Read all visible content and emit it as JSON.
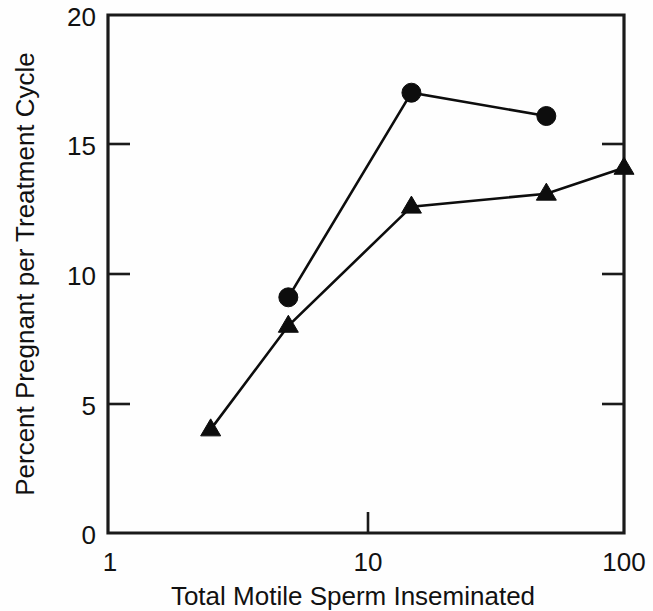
{
  "chart_data": {
    "type": "line",
    "title": "",
    "subtitle": "",
    "xlabel": "Total Motile Sperm Inseminated",
    "ylabel": "Percent Pregnant per Treatment Cycle",
    "xscale": "log",
    "yscale": "linear",
    "xlim": [
      1,
      100
    ],
    "ylim": [
      0,
      20
    ],
    "xticks": [
      1,
      10,
      100
    ],
    "xtick_labels": [
      "1",
      "10",
      "100"
    ],
    "yticks": [
      0,
      5,
      10,
      15,
      20
    ],
    "ytick_labels": [
      "0",
      "5",
      "10",
      "15",
      "20"
    ],
    "grid": false,
    "legend": "none",
    "marker_color": "#0d0d0d",
    "line_color": "#0d0d0d",
    "background_color": "#fefefe",
    "series": [
      {
        "name": "circle-series",
        "marker": "circle",
        "x": [
          5,
          15,
          50
        ],
        "y": [
          9.1,
          17.0,
          16.1
        ]
      },
      {
        "name": "triangle-series",
        "marker": "triangle",
        "x": [
          2.5,
          5,
          15,
          50,
          100
        ],
        "y": [
          4.0,
          8.0,
          12.6,
          13.1,
          14.1
        ]
      }
    ]
  },
  "axes": {
    "y_title": "Percent Pregnant per Treatment Cycle",
    "x_title": "Total Motile Sperm Inseminated",
    "y_tick_20": "20",
    "y_tick_15": "15",
    "y_tick_10": "10",
    "y_tick_5": "5",
    "y_tick_0": "0",
    "x_tick_1": "1",
    "x_tick_10": "10",
    "x_tick_100": "100"
  }
}
